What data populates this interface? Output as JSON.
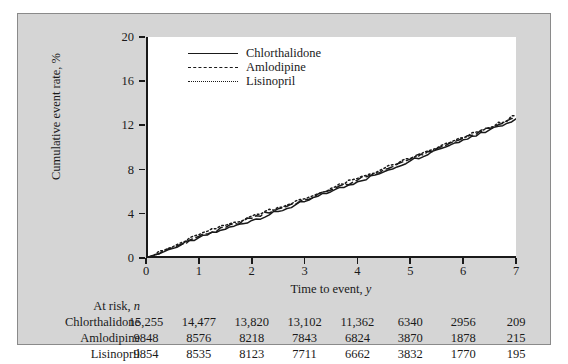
{
  "chart_data": {
    "type": "line",
    "title": "",
    "xlabel": "Time to event, y",
    "ylabel": "Cumulative event rate, %",
    "xlim": [
      0,
      7
    ],
    "ylim": [
      0,
      20
    ],
    "xticks": [
      "0",
      "1",
      "2",
      "3",
      "4",
      "5",
      "6",
      "7"
    ],
    "yticks": [
      "0",
      "4",
      "8",
      "12",
      "16",
      "20"
    ],
    "grid": false,
    "legend_position": "top-left-inside",
    "x": [
      0,
      0.5,
      1,
      1.5,
      2,
      2.5,
      3,
      3.5,
      4,
      4.5,
      5,
      5.5,
      6,
      6.5,
      7
    ],
    "series": [
      {
        "name": "Chlorthalidone",
        "style": "solid",
        "values": [
          0,
          0.85,
          1.85,
          2.6,
          3.4,
          4.2,
          5.1,
          6.0,
          6.9,
          7.8,
          8.8,
          9.8,
          10.7,
          11.6,
          12.6
        ]
      },
      {
        "name": "Amlodipine",
        "style": "dashed",
        "values": [
          0,
          0.9,
          1.95,
          2.75,
          3.6,
          4.45,
          5.25,
          6.15,
          7.05,
          8.0,
          8.95,
          9.9,
          10.85,
          11.75,
          12.7
        ]
      },
      {
        "name": "Lisinopril",
        "style": "dotted",
        "values": [
          0,
          1.0,
          2.1,
          2.95,
          3.8,
          4.6,
          5.35,
          6.3,
          7.2,
          8.1,
          9.0,
          9.95,
          10.9,
          11.8,
          12.9
        ]
      }
    ]
  },
  "legend": {
    "items": [
      {
        "label": "Chlorthalidone",
        "style": "solid"
      },
      {
        "label": "Amlodipine",
        "style": "dashed"
      },
      {
        "label": "Lisinopril",
        "style": "dotted"
      }
    ]
  },
  "at_risk": {
    "header": "At risk, n",
    "header_prefix": "At risk, ",
    "header_italic": "n",
    "rows": [
      {
        "label": "Chlorthalidone",
        "values": [
          "15,255",
          "14,477",
          "13,820",
          "13,102",
          "11,362",
          "6340",
          "2956",
          "209"
        ]
      },
      {
        "label": "Amlodipine",
        "values": [
          "9848",
          "8576",
          "8218",
          "7843",
          "6824",
          "3870",
          "1878",
          "215"
        ]
      },
      {
        "label": "Lisinopril",
        "values": [
          "9854",
          "8535",
          "8123",
          "7711",
          "6662",
          "3832",
          "1770",
          "195"
        ]
      }
    ]
  },
  "colors": {
    "figure_background": "#d5d5d5",
    "plot_background": "#ffffff",
    "ink": "#1a1a1a",
    "page_background": "#ffffff"
  }
}
